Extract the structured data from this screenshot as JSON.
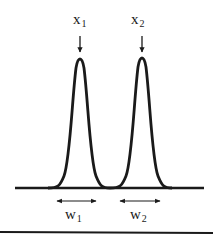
{
  "diagram": {
    "type": "two-peak resolution diagram",
    "peaks": [
      {
        "label_main": "x",
        "label_sub": "1",
        "center_x": 80,
        "peak_y": 58
      },
      {
        "label_main": "x",
        "label_sub": "2",
        "center_x": 142,
        "peak_y": 57
      }
    ],
    "widths": [
      {
        "label_main": "w",
        "label_sub": "1",
        "x_start": 57,
        "x_end": 96
      },
      {
        "label_main": "w",
        "label_sub": "2",
        "x_start": 120,
        "x_end": 160
      }
    ],
    "baseline": {
      "y": 188,
      "x_start": 15,
      "x_end": 204
    },
    "bottom_rule": {
      "y": 232
    },
    "colors": {
      "stroke": "#1a1a1a",
      "background": "#ffffff"
    }
  }
}
